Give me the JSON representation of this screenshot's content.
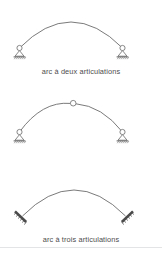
{
  "figure": {
    "background_color": "#ffffff",
    "stroke_color": "#595959",
    "text_color": "#4d4d4d",
    "divider_color": "#e3e4e6",
    "diagrams": [
      {
        "id": "two-hinged",
        "caption": "arc à deux articulations",
        "support_type": "pin-roller",
        "hinges": 2,
        "arc": {
          "start_x": 19,
          "start_y": 48,
          "end_x": 123,
          "end_y": 48,
          "apex_x": 71,
          "apex_y": 16
        }
      },
      {
        "id": "three-hinged",
        "caption": "arc à trois articulations",
        "support_type": "pin-roller",
        "hinges": 3,
        "crown_hinge": {
          "x": 73,
          "y": 19,
          "r": 3
        },
        "arc": {
          "start_x": 19,
          "start_y": 48,
          "end_x": 123,
          "end_y": 48,
          "apex_x": 73,
          "apex_y": 19
        }
      },
      {
        "id": "fixed",
        "caption": "arc encastré",
        "support_type": "fixed",
        "hinges": 0,
        "arc": {
          "start_x": 22,
          "start_y": 46,
          "end_x": 126,
          "end_y": 46,
          "apex_x": 74,
          "apex_y": 13
        }
      }
    ]
  }
}
